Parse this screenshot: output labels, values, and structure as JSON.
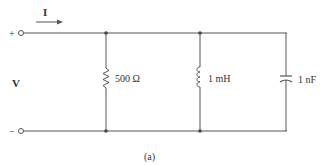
{
  "diagram": {
    "type": "parallel RLC circuit",
    "current_label": "I",
    "voltage_label": "V",
    "plus_terminal": "+",
    "minus_terminal": "−",
    "components": [
      {
        "kind": "resistor",
        "label": "500 Ω"
      },
      {
        "kind": "inductor",
        "label": "1 mH"
      },
      {
        "kind": "capacitor",
        "label": "1 nF"
      }
    ],
    "caption": "(a)",
    "colors": {
      "wire": "#555555",
      "text": "#333333"
    }
  }
}
